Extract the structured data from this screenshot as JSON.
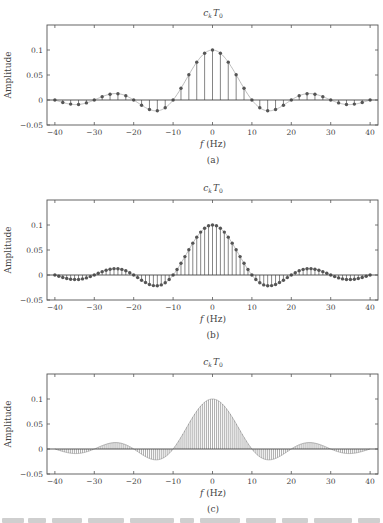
{
  "chart_data": [
    {
      "id": "a",
      "type": "stem",
      "title": "c_k T_0",
      "title_main": "c",
      "title_sub1": "k",
      "title_main2": "T",
      "title_sub2": "0",
      "xlabel": "f (Hz)",
      "xlabel_var": "f",
      "xlabel_unit": "(Hz)",
      "ylabel": "Amplitude",
      "subcaption": "(a)",
      "xlim": [
        -42,
        42
      ],
      "ylim": [
        -0.05,
        0.15
      ],
      "xticks": [
        -40,
        -30,
        -20,
        -10,
        0,
        10,
        20,
        30,
        40
      ],
      "xtick_labels": [
        "−40",
        "−30",
        "−20",
        "−10",
        "0",
        "10",
        "20",
        "30",
        "40"
      ],
      "yticks": [
        -0.05,
        0,
        0.05,
        0.1
      ],
      "ytick_labels": [
        "−0.05",
        "0",
        "0.05",
        "0.1"
      ],
      "grid": false,
      "envelope": "0.1*sinc(f/10)",
      "markers": true,
      "spacing_hz": 2,
      "x": [
        -40,
        -38,
        -36,
        -34,
        -32,
        -30,
        -28,
        -26,
        -24,
        -22,
        -20,
        -18,
        -16,
        -14,
        -12,
        -10,
        -8,
        -6,
        -4,
        -2,
        0,
        2,
        4,
        6,
        8,
        10,
        12,
        14,
        16,
        18,
        20,
        22,
        24,
        26,
        28,
        30,
        32,
        34,
        36,
        38,
        40
      ],
      "values": [
        0.0,
        -0.0049,
        -0.0082,
        -0.0089,
        -0.0058,
        0.0,
        0.0067,
        0.0116,
        0.0126,
        0.0085,
        0.0,
        -0.0104,
        -0.0189,
        -0.0216,
        -0.0156,
        0.0,
        0.0234,
        0.0505,
        0.0757,
        0.0935,
        0.1,
        0.0935,
        0.0757,
        0.0505,
        0.0234,
        0.0,
        -0.0156,
        -0.0216,
        -0.0189,
        -0.0104,
        0.0,
        0.0085,
        0.0126,
        0.0116,
        0.0067,
        0.0,
        -0.0058,
        -0.0089,
        -0.0082,
        -0.0049,
        0.0
      ]
    },
    {
      "id": "b",
      "type": "stem",
      "title": "c_k T_0",
      "title_main": "c",
      "title_sub1": "k",
      "title_main2": "T",
      "title_sub2": "0",
      "xlabel": "f (Hz)",
      "xlabel_var": "f",
      "xlabel_unit": "(Hz)",
      "ylabel": "Amplitude",
      "subcaption": "(b)",
      "xlim": [
        -42,
        42
      ],
      "ylim": [
        -0.05,
        0.15
      ],
      "xticks": [
        -40,
        -30,
        -20,
        -10,
        0,
        10,
        20,
        30,
        40
      ],
      "xtick_labels": [
        "−40",
        "−30",
        "−20",
        "−10",
        "0",
        "10",
        "20",
        "30",
        "40"
      ],
      "yticks": [
        -0.05,
        0,
        0.05,
        0.1
      ],
      "ytick_labels": [
        "−0.05",
        "0",
        "0.05",
        "0.1"
      ],
      "grid": false,
      "envelope": "0.1*sinc(f/10)",
      "markers": true,
      "spacing_hz": 1,
      "x_range": [
        -40,
        40
      ]
    },
    {
      "id": "c",
      "type": "stem",
      "title": "c_k T_0",
      "title_main": "c",
      "title_sub1": "k",
      "title_main2": "T",
      "title_sub2": "0",
      "xlabel": "f (Hz)",
      "xlabel_var": "f",
      "xlabel_unit": "(Hz)",
      "ylabel": "Amplitude",
      "subcaption": "(c)",
      "xlim": [
        -42,
        42
      ],
      "ylim": [
        -0.05,
        0.15
      ],
      "xticks": [
        -40,
        -30,
        -20,
        -10,
        0,
        10,
        20,
        30,
        40
      ],
      "xtick_labels": [
        "−40",
        "−30",
        "−20",
        "−10",
        "0",
        "10",
        "20",
        "30",
        "40"
      ],
      "yticks": [
        -0.05,
        0,
        0.05,
        0.1
      ],
      "ytick_labels": [
        "−0.05",
        "0",
        "0.05",
        "0.1"
      ],
      "grid": false,
      "envelope": "0.1*sinc(f/10)",
      "markers": false,
      "spacing_hz": 0.5,
      "x_range": [
        -40,
        40
      ]
    }
  ],
  "style": {
    "axis_color": "#555555",
    "stem_color": "#777777",
    "marker_color": "#555555",
    "envelope_color": "#bbbbbb"
  }
}
